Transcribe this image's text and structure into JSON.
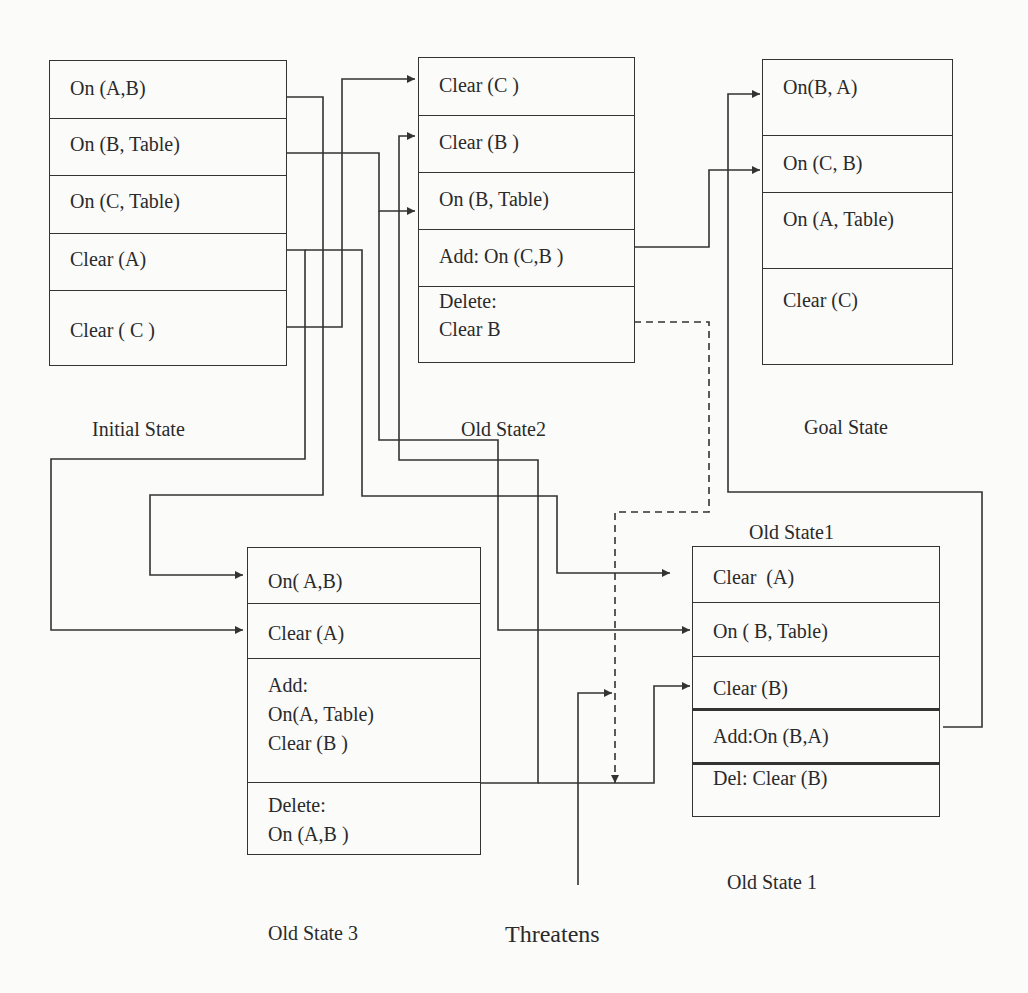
{
  "diagram": {
    "boxes": {
      "initial": {
        "caption": "Initial State",
        "rows": [
          "On (A,B)",
          "On (B, Table)",
          "On (C, Table)",
          "Clear (A)",
          "Clear ( C )"
        ]
      },
      "old_state2": {
        "caption": "Old State2",
        "rows": [
          "Clear (C )",
          "Clear (B )",
          "On (B, Table)",
          "Add: On (C,B )",
          "Delete:\nClear B"
        ]
      },
      "goal": {
        "caption": "Goal State",
        "rows": [
          "On(B, A)",
          "On (C, B)",
          "On (A, Table)",
          "Clear (C)"
        ]
      },
      "old_state3": {
        "caption": "Old State 3",
        "rows": [
          "On( A,B)",
          "Clear (A)",
          "Add:\nOn(A, Table)\nClear (B )",
          "Delete:\nOn (A,B )"
        ]
      },
      "old_state1": {
        "caption_top": "Old State1",
        "caption": "Old State 1",
        "rows": [
          "Clear  (A)",
          "On ( B, Table)",
          "Clear (B)",
          "Add:On (B,A)",
          "Del: Clear (B)"
        ]
      }
    },
    "threat_label": "Threatens",
    "colors": {
      "line": "#333333",
      "background": "#fbfbfa",
      "text": "#2a2a2a"
    }
  }
}
